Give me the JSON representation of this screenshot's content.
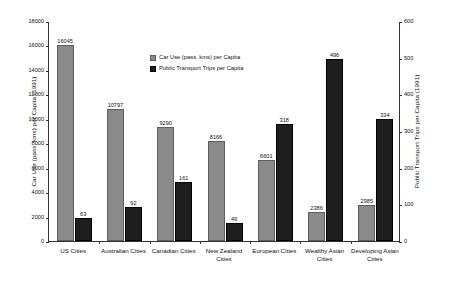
{
  "chart_data": {
    "type": "bar",
    "title": "",
    "categories": [
      "US Cities",
      "Australian Cities",
      "Canadian Cities",
      "New Zealand Cities",
      "European Cities",
      "Wealthy Asian Cities",
      "Developing Asian Cities"
    ],
    "series": [
      {
        "name": "Car Use (pass. kms)  per Capita",
        "axis": "left",
        "values": [
          16045,
          10797,
          9290,
          8166,
          6601,
          2386,
          2985
        ]
      },
      {
        "name": "Public Transport Trips per Capita",
        "axis": "right",
        "values": [
          63,
          92,
          161,
          49,
          318,
          496,
          334
        ]
      }
    ],
    "ylabel": "Car Use (pass. kms) per Capita (1991)",
    "y2label": "Public Transport Trips per Capita (1991)",
    "xlabel": "",
    "ylim": [
      0,
      18000
    ],
    "y2lim": [
      0,
      600
    ],
    "yticks": [
      0,
      2000,
      4000,
      6000,
      8000,
      10000,
      12000,
      14000,
      16000,
      18000
    ],
    "y2ticks": [
      0,
      100,
      200,
      300,
      400,
      500,
      600
    ],
    "grid": false,
    "legend_position": "top-left-inside",
    "colors": {
      "car_use": "#8a8a8a",
      "public_transport": "#1e1e1e",
      "axis": "#333333",
      "text": "#111111",
      "background": "#ffffff"
    }
  },
  "legend": {
    "items": [
      {
        "label": "Car Use (pass. kms)  per Capita",
        "swatch": "car"
      },
      {
        "label": "Public Transport Trips per Capita",
        "swatch": "pt"
      }
    ]
  },
  "axes": {
    "left_title": "Car Use (pass. kms) per Capita (1991)",
    "right_title": "Public Transport Trips per Capita (1991)",
    "left_ticklabels": [
      "18000",
      "16000",
      "14000",
      "12000",
      "10000",
      "8000",
      "6000",
      "4000",
      "2000",
      "0"
    ],
    "right_ticklabels": [
      "600",
      "500",
      "400",
      "300",
      "200",
      "100",
      "0"
    ]
  }
}
